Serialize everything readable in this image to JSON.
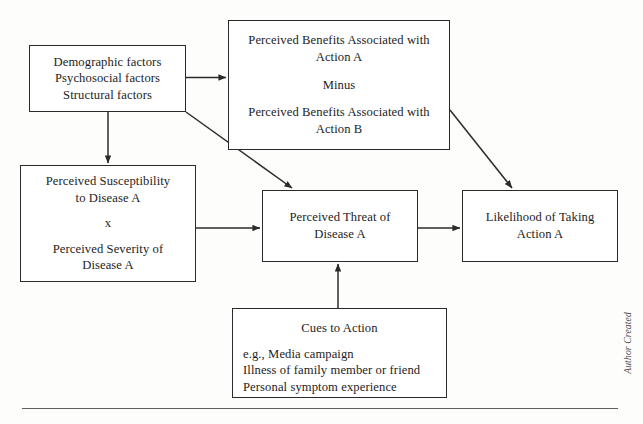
{
  "diagram": {
    "credit": "Author Created",
    "boxes": {
      "factors": {
        "lines": [
          "Demographic factors",
          "Psychosocial factors",
          "Structural factors"
        ]
      },
      "benefits": {
        "line1": "Perceived Benefits Associated with",
        "line2": "Action A",
        "operator": "Minus",
        "line3": "Perceived Benefits Associated with",
        "line4": "Action B"
      },
      "susceptibility": {
        "line1": "Perceived Susceptibility",
        "line2": "to Disease A",
        "operator": "x",
        "line3": "Perceived Severity of",
        "line4": "Disease A"
      },
      "threat": {
        "line1": "Perceived Threat of",
        "line2": "Disease A"
      },
      "likelihood": {
        "line1": "Likelihood of Taking",
        "line2": "Action A"
      },
      "cues": {
        "title": "Cues to Action",
        "items": [
          "e.g., Media campaign",
          "Illness of family member or friend",
          "Personal symptom experience"
        ]
      }
    },
    "arrows": [
      {
        "name": "factors-to-benefits",
        "from": "factors",
        "to": "benefits",
        "direction": "right"
      },
      {
        "name": "factors-to-susceptibility",
        "from": "factors",
        "to": "susceptibility",
        "direction": "down"
      },
      {
        "name": "factors-to-threat",
        "from": "factors",
        "to": "threat",
        "direction": "diagonal-down-right"
      },
      {
        "name": "benefits-to-likelihood",
        "from": "benefits",
        "to": "likelihood",
        "direction": "diagonal-down-right"
      },
      {
        "name": "susceptibility-to-threat",
        "from": "susceptibility",
        "to": "threat",
        "direction": "right"
      },
      {
        "name": "threat-to-likelihood",
        "from": "threat",
        "to": "likelihood",
        "direction": "right"
      },
      {
        "name": "cues-to-threat",
        "from": "cues",
        "to": "threat",
        "direction": "up"
      }
    ],
    "colors": {
      "border": "#2b2b2b",
      "text": "#1d1d1d",
      "background": "#ffffff",
      "rule": "#5f5f5f"
    }
  }
}
